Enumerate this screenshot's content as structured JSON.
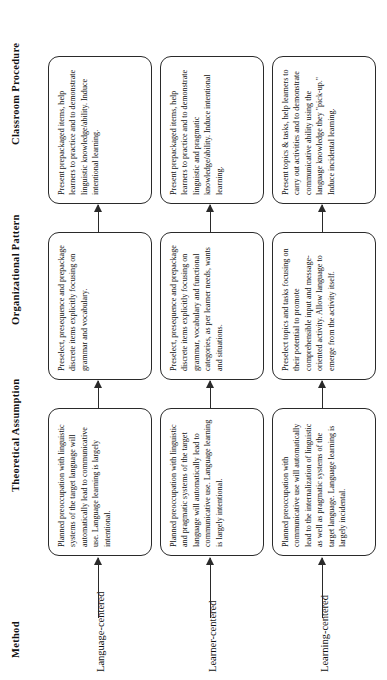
{
  "figure": {
    "orientation": "rotated-90-ccw",
    "type": "flowchart-matrix",
    "stroke_color": "#2a2a2a",
    "text_color": "#111111",
    "background_color": "#ffffff"
  },
  "columns": [
    {
      "key": "method",
      "label": "Method"
    },
    {
      "key": "theoretical",
      "label": "Theoretical Assumption"
    },
    {
      "key": "organizational",
      "label": "Organizational Pattern"
    },
    {
      "key": "classroom",
      "label": "Classroom  Procedure"
    }
  ],
  "rows": [
    {
      "method": "Language-centered",
      "theoretical": "Planned preoccupation with linguistic systems of the target language will automatically lead to communicative use. Language learning is largely intentional.",
      "organizational": "Preselect, presequence and prepackage discrete items explicitly focusing on grammar and vocabulary.",
      "classroom": "Present prepackaged items, help learners to practice and to demonstrate linguistic knowledge/ability. Induce intentional learning."
    },
    {
      "method": "Learner-centered",
      "theoretical": "Planned preoccupation with linguistic and pragmatic systems of the target language will automatically lead to communicative use. Language learning is largely intentional.",
      "organizational": "Preselect, presequence and prepackage discrete items explicitly focusing on grammar, vocabulary and functional categories, as per learner needs, wants and situations.",
      "classroom": "Present prepackaged items, help learners to practice and to demonstrate linguistic and pragmatic knowledge/ability. Induce intentional learning."
    },
    {
      "method": "Learning-centered",
      "theoretical": "Planned preoccupation with communicative use will automatically lead to the internalization of linguistic as well as pragmatic systems of the target language. Language learning is largely incidental.",
      "organizational": "Preselect topics and tasks focusing on their potential to promote comprehensible input and message-oriented activity. Allow language to emerge from the activity itself.",
      "classroom": "Present topics & tasks, help learners to carry out activities and to demonstrate communicative ability using the language knowledge they \"pick-up.\" Induce incidental learning."
    }
  ]
}
